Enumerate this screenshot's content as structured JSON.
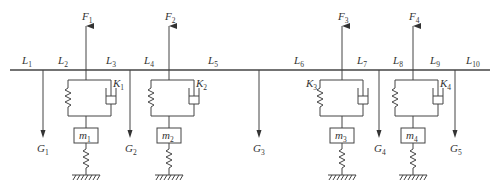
{
  "beam": {
    "x1": 10,
    "x2": 490,
    "y": 70
  },
  "length_labels": [
    {
      "base": "L",
      "sub": "1",
      "x": 22,
      "y": 64
    },
    {
      "base": "L",
      "sub": "2",
      "x": 58,
      "y": 64
    },
    {
      "base": "L",
      "sub": "3",
      "x": 106,
      "y": 64
    },
    {
      "base": "L",
      "sub": "4",
      "x": 144,
      "y": 64
    },
    {
      "base": "L",
      "sub": "5",
      "x": 208,
      "y": 64
    },
    {
      "base": "L",
      "sub": "6",
      "x": 294,
      "y": 64
    },
    {
      "base": "L",
      "sub": "7",
      "x": 357,
      "y": 64
    },
    {
      "base": "L",
      "sub": "8",
      "x": 393,
      "y": 64
    },
    {
      "base": "L",
      "sub": "9",
      "x": 430,
      "y": 64
    },
    {
      "base": "L",
      "sub": "10",
      "x": 466,
      "y": 64
    }
  ],
  "forces": [
    {
      "base": "F",
      "sub": "1",
      "x": 86,
      "label_x": 82
    },
    {
      "base": "F",
      "sub": "2",
      "x": 169,
      "label_x": 165
    },
    {
      "base": "F",
      "sub": "3",
      "x": 342,
      "label_x": 338
    },
    {
      "base": "F",
      "sub": "4",
      "x": 413,
      "label_x": 409
    }
  ],
  "weights": [
    {
      "base": "G",
      "sub": "1",
      "x": 43,
      "label_x": 37
    },
    {
      "base": "G",
      "sub": "2",
      "x": 130,
      "label_x": 125
    },
    {
      "base": "G",
      "sub": "3",
      "x": 259,
      "label_x": 253
    },
    {
      "base": "G",
      "sub": "4",
      "x": 379,
      "label_x": 374
    },
    {
      "base": "G",
      "sub": "5",
      "x": 455,
      "label_x": 450
    }
  ],
  "suspensions": [
    {
      "x": 86,
      "left": 68,
      "right": 111,
      "k": {
        "base": "K",
        "sub": "1",
        "x": 113,
        "y": 87
      },
      "m": {
        "base": "m",
        "sub": "1"
      },
      "damper": true
    },
    {
      "x": 169,
      "left": 151,
      "right": 194,
      "k": {
        "base": "K",
        "sub": "2",
        "x": 196,
        "y": 87
      },
      "m": {
        "base": "m",
        "sub": "2"
      },
      "damper": true
    },
    {
      "x": 342,
      "left": 320,
      "right": 363,
      "k": {
        "base": "K",
        "sub": "3",
        "x": 306,
        "y": 87
      },
      "m": {
        "base": "m",
        "sub": "3"
      },
      "damper": true
    },
    {
      "x": 413,
      "left": 395,
      "right": 438,
      "k": {
        "base": "K",
        "sub": "4",
        "x": 440,
        "y": 87
      },
      "m": {
        "base": "m",
        "sub": "4"
      },
      "damper": true
    }
  ],
  "colors": {
    "line": "#444444",
    "text": "#333333",
    "background": "#ffffff"
  }
}
